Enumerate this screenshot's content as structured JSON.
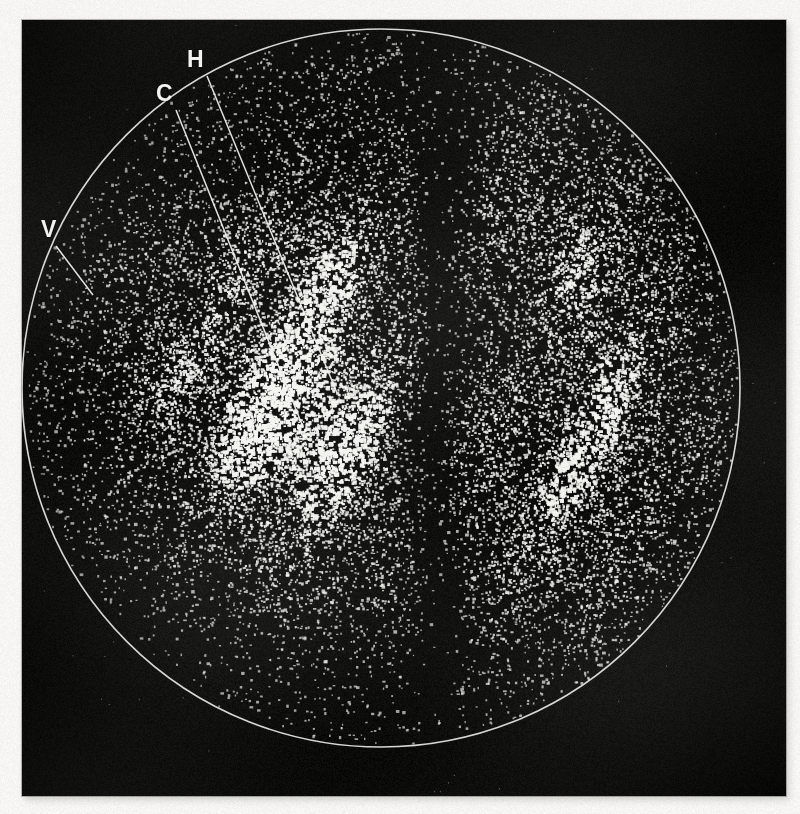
{
  "image": {
    "kind": "scintigram",
    "modality": "gamma-camera-scintigraphy",
    "view": "anterior",
    "width": 800,
    "height": 814,
    "paper_color": "#f6f5f3",
    "plate_color": "#0e0d0c",
    "count_color": "#f4f4f0",
    "outline_color": "#e8e8e4"
  },
  "plate": {
    "x": 22,
    "y": 20,
    "width": 764,
    "height": 776
  },
  "field_of_view": {
    "shape": "circle",
    "center_x": 381,
    "center_y": 388,
    "radius": 359,
    "outline_width": 1.6
  },
  "annotations": [
    {
      "id": "H",
      "label": "H",
      "label_x": 187,
      "label_y": 48,
      "leader": {
        "x1": 207,
        "y1": 76,
        "x2": 337,
        "y2": 393
      }
    },
    {
      "id": "C",
      "label": "C",
      "label_x": 156,
      "label_y": 82,
      "leader": {
        "x1": 176,
        "y1": 110,
        "x2": 303,
        "y2": 427
      }
    },
    {
      "id": "V",
      "label": "V",
      "label_x": 41,
      "label_y": 218,
      "leader": {
        "x1": 56,
        "y1": 246,
        "x2": 93,
        "y2": 295
      }
    }
  ],
  "chart_data": {
    "type": "scatter",
    "title": "",
    "xlabel": "",
    "ylabel": "",
    "field": {
      "cx": 381,
      "cy": 388,
      "r": 359
    },
    "total_counts": 17000,
    "background_density": 0.42,
    "legend_position": "none",
    "grid": false,
    "midline_defect": {
      "name": "central photopenic band",
      "x_center": 438,
      "half_width": 30,
      "y_top": 60,
      "y_bottom": 700,
      "suppression": 0.88
    },
    "hot_spots": [
      {
        "name": "left-central-uptake",
        "x": 300,
        "y": 430,
        "rx": 110,
        "ry": 95,
        "gain": 1.55
      },
      {
        "name": "left-superior-focus",
        "x": 318,
        "y": 252,
        "rx": 62,
        "ry": 52,
        "gain": 1.4
      },
      {
        "name": "left-lateral-focus",
        "x": 135,
        "y": 378,
        "rx": 58,
        "ry": 40,
        "gain": 1.35
      },
      {
        "name": "right-superior-field",
        "x": 600,
        "y": 210,
        "rx": 120,
        "ry": 110,
        "gain": 1.3
      },
      {
        "name": "right-inferior-field",
        "x": 590,
        "y": 560,
        "rx": 115,
        "ry": 100,
        "gain": 1.32
      },
      {
        "name": "right-mid-band",
        "x": 640,
        "y": 400,
        "rx": 80,
        "ry": 90,
        "gain": 1.12
      }
    ],
    "cold_spots": [
      {
        "name": "left-superior-margin",
        "x": 215,
        "y": 160,
        "rx": 95,
        "ry": 80,
        "suppression": 0.45
      },
      {
        "name": "right-mid-notch",
        "x": 520,
        "y": 330,
        "rx": 45,
        "ry": 70,
        "suppression": 0.4
      },
      {
        "name": "inferior-margin",
        "x": 330,
        "y": 690,
        "rx": 160,
        "ry": 70,
        "suppression": 0.55
      },
      {
        "name": "left-inferior-margin",
        "x": 150,
        "y": 620,
        "rx": 90,
        "ry": 80,
        "suppression": 0.5
      }
    ],
    "series": [
      {
        "name": "counts",
        "values": []
      }
    ]
  }
}
